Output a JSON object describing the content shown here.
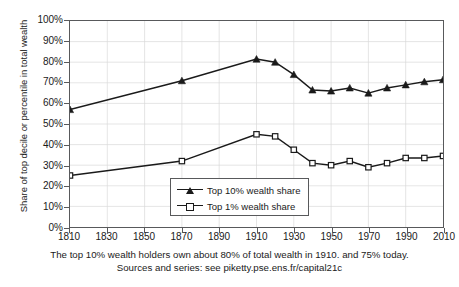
{
  "chart_data": {
    "type": "line",
    "title": "",
    "xlabel": "",
    "ylabel": "Share of top decile or percentile in total wealth",
    "xlim": [
      1810,
      2010
    ],
    "ylim": [
      0,
      100
    ],
    "grid": true,
    "legend_position": "inside-bottom-center",
    "xticks": [
      "1810",
      "1830",
      "1850",
      "1870",
      "1890",
      "1910",
      "1930",
      "1950",
      "1970",
      "1990",
      "2010"
    ],
    "xtick_values": [
      1810,
      1830,
      1850,
      1870,
      1890,
      1910,
      1930,
      1950,
      1970,
      1990,
      2010
    ],
    "yticks": [
      "0%",
      "10%",
      "20%",
      "30%",
      "40%",
      "50%",
      "60%",
      "70%",
      "80%",
      "90%",
      "100%"
    ],
    "ytick_values": [
      0,
      10,
      20,
      30,
      40,
      50,
      60,
      70,
      80,
      90,
      100
    ],
    "series": [
      {
        "name": "Top 10% wealth share",
        "marker": "filled-triangle",
        "color": "#1a1a1a",
        "x": [
          1810,
          1870,
          1910,
          1920,
          1930,
          1940,
          1950,
          1960,
          1970,
          1980,
          1990,
          2000,
          2010
        ],
        "values": [
          57,
          71,
          81.5,
          80,
          74,
          66.5,
          66,
          67.5,
          65,
          67.5,
          69,
          70.5,
          71.5
        ]
      },
      {
        "name": "Top 1% wealth share",
        "marker": "open-square",
        "color": "#1a1a1a",
        "x": [
          1810,
          1870,
          1910,
          1920,
          1930,
          1940,
          1950,
          1960,
          1970,
          1980,
          1990,
          2000,
          2010
        ],
        "values": [
          25,
          32,
          45,
          44,
          37.5,
          31,
          30,
          32,
          29,
          31,
          33.5,
          33.5,
          34.5
        ]
      }
    ],
    "annotations": [
      "The top 10% wealth holders own about 80% of total wealth in 1910. and 75% today.",
      "Sources and series: see piketty.pse.ens.fr/capital21c"
    ]
  },
  "legend": {
    "items": [
      {
        "label": "Top 10% wealth share",
        "marker": "filled-triangle"
      },
      {
        "label": "Top 1% wealth share",
        "marker": "open-square"
      }
    ]
  },
  "caption": {
    "line1": "The top 10% wealth holders own about 80% of total wealth in 1910. and 75% today.",
    "line2": "Sources and series: see piketty.pse.ens.fr/capital21c"
  },
  "colors": {
    "axis": "#58595b",
    "grid": "#d9d9d9",
    "series": "#1a1a1a",
    "background": "#ffffff"
  }
}
